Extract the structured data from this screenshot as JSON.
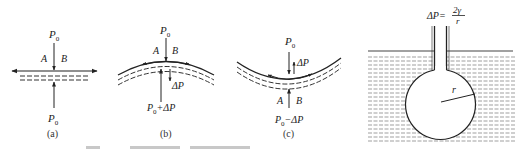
{
  "figure": {
    "panels": [
      {
        "id": "a",
        "caption": "(a)",
        "surface": "flat",
        "labels": {
          "top_pressure": "P",
          "top_sub": "0",
          "left": "A",
          "right": "B",
          "bottom_pressure": "P",
          "bottom_sub": "0"
        }
      },
      {
        "id": "b",
        "caption": "(b)",
        "surface": "convex",
        "labels": {
          "top_pressure": "P",
          "top_sub": "0",
          "left": "A",
          "right": "B",
          "delta": "ΔP",
          "bottom_pressure": "P",
          "bottom_sub": "0",
          "bottom_suffix": "+ΔP"
        }
      },
      {
        "id": "c",
        "caption": "(c)",
        "surface": "concave",
        "labels": {
          "top_pressure": "P",
          "top_sub": "0",
          "delta": "ΔP",
          "left": "A",
          "right": "B",
          "bottom_pressure": "P",
          "bottom_sub": "0",
          "bottom_suffix": "−ΔP"
        }
      },
      {
        "id": "d",
        "caption": "",
        "surface": "bubble-in-liquid",
        "labels": {
          "formula_lhs": "ΔP=",
          "formula_num": "2γ",
          "formula_den": "r",
          "radius": "r"
        }
      }
    ]
  }
}
